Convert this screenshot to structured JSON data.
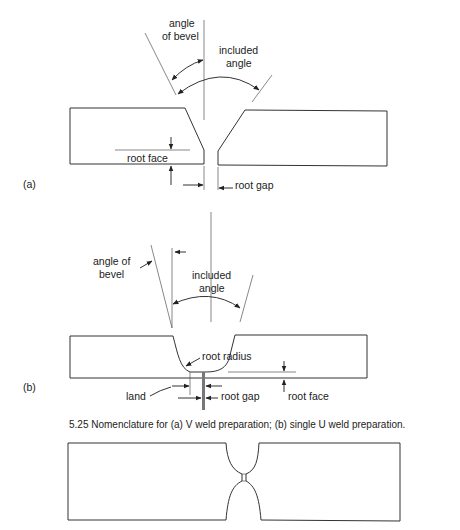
{
  "figure_a": {
    "panel_label": "(a)",
    "labels": {
      "angle_of_bevel_line1": "angle",
      "angle_of_bevel_line2": "of bevel",
      "included_angle_line1": "included",
      "included_angle_line2": "angle",
      "root_face": "root face",
      "root_gap": "root gap"
    }
  },
  "figure_b": {
    "panel_label": "(b)",
    "labels": {
      "angle_of_bevel_line1": "angle of",
      "angle_of_bevel_line2": "bevel",
      "included_angle_line1": "included",
      "included_angle_line2": "angle",
      "root_radius": "root radius",
      "land": "land",
      "root_gap": "root gap",
      "root_face": "root face"
    }
  },
  "caption": "5.25  Nomenclature for (a) V weld preparation; (b) single U weld preparation.",
  "figure_c": {
    "description": "double U weld preparation outline"
  }
}
